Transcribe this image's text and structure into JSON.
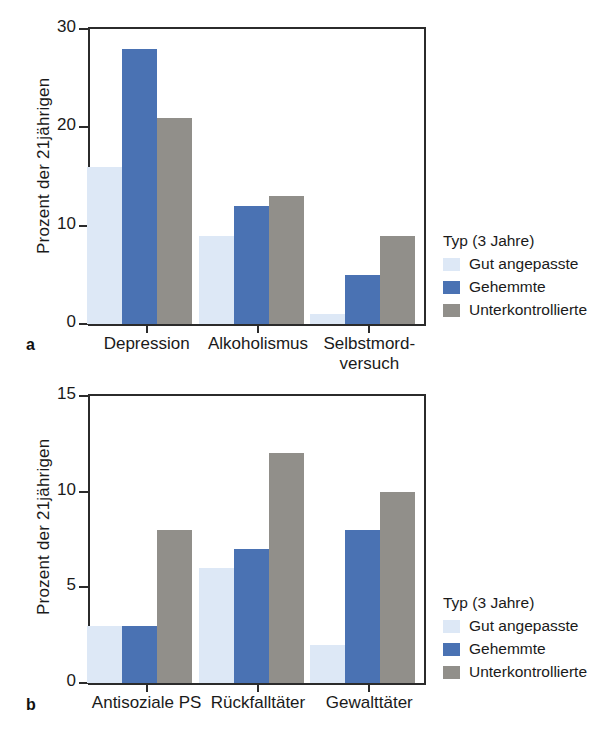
{
  "figure": {
    "ylabel": "Prozent der 21jährigen",
    "legend_title": "Typ (3 Jahre)",
    "series_names": [
      "Gut angepasste",
      "Gehemmte",
      "Unterkontrollierte"
    ],
    "colors": [
      "#dde8f6",
      "#4a72b3",
      "#918f8a"
    ],
    "panel_a_letter": "a",
    "panel_b_letter": "b"
  },
  "chart_data": [
    {
      "type": "bar",
      "panel": "a",
      "title": "",
      "xlabel": "",
      "ylabel": "Prozent der 21jährigen",
      "categories": [
        "Depression",
        "Alkoholismus",
        "Selbstmord-\nversuch"
      ],
      "category_lines": [
        [
          "Depression"
        ],
        [
          "Alkoholismus"
        ],
        [
          "Selbstmord-",
          "versuch"
        ]
      ],
      "series": [
        {
          "name": "Gut angepasste",
          "color": "#dde8f6",
          "values": [
            16,
            9,
            1
          ]
        },
        {
          "name": "Gehemmte",
          "color": "#4a72b3",
          "values": [
            28,
            12,
            5
          ]
        },
        {
          "name": "Unterkontrollierte",
          "color": "#918f8a",
          "values": [
            21,
            13,
            9
          ]
        }
      ],
      "ylim": [
        0,
        30
      ],
      "yticks": [
        0,
        10,
        20,
        30
      ],
      "ytick_labels": [
        "0",
        "10",
        "20",
        "30"
      ],
      "grid": false,
      "legend_position": "right"
    },
    {
      "type": "bar",
      "panel": "b",
      "title": "",
      "xlabel": "",
      "ylabel": "Prozent der 21jährigen",
      "categories": [
        "Antisoziale PS",
        "Rückfalltäter",
        "Gewalttäter"
      ],
      "category_lines": [
        [
          "Antisoziale PS"
        ],
        [
          "Rückfalltäter"
        ],
        [
          "Gewalttäter"
        ]
      ],
      "series": [
        {
          "name": "Gut angepasste",
          "color": "#dde8f6",
          "values": [
            3,
            6,
            2
          ]
        },
        {
          "name": "Gehemmte",
          "color": "#4a72b3",
          "values": [
            3,
            7,
            8
          ]
        },
        {
          "name": "Unterkontrollierte",
          "color": "#918f8a",
          "values": [
            8,
            12,
            10
          ]
        }
      ],
      "ylim": [
        0,
        15
      ],
      "yticks": [
        0,
        5,
        10,
        15
      ],
      "ytick_labels": [
        "0",
        "5",
        "10",
        "15"
      ],
      "grid": false,
      "legend_position": "right"
    }
  ]
}
